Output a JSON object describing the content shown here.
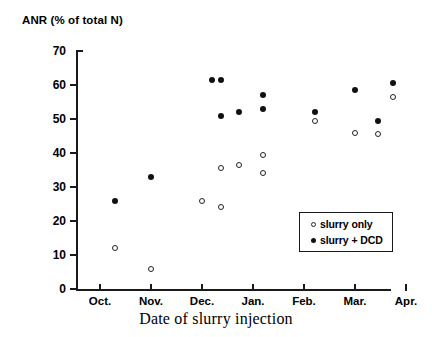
{
  "chart_data": {
    "type": "scatter",
    "title": "",
    "ylabel": "ANR (% of total N)",
    "xlabel": "Date of slurry injection",
    "ylim": [
      0,
      70
    ],
    "yticks": [
      0,
      10,
      20,
      30,
      40,
      50,
      60,
      70
    ],
    "ytick_labels": [
      "0",
      "10",
      "20",
      "30",
      "40",
      "50",
      "60",
      "70"
    ],
    "xtick_labels": [
      "Oct.",
      "Nov.",
      "Dec.",
      "Jan.",
      "Feb.",
      "Mar.",
      "Apr."
    ],
    "grid": false,
    "legend_position": "lower-right-inside",
    "series": [
      {
        "name": "slurry only",
        "marker": "open-circle",
        "color": "#ffffff",
        "edge_color": "#222222",
        "points": [
          {
            "x": "Oct.",
            "x_frac": 0.06,
            "y": 12.0
          },
          {
            "x": "Oct.-Nov.",
            "x_frac": 0.2,
            "y": 6.0
          },
          {
            "x": "Nov.-Dec.",
            "x_frac": 0.4,
            "y": 26.0
          },
          {
            "x": "Dec.",
            "x_frac": 0.475,
            "y": 24.0
          },
          {
            "x": "Dec.",
            "x_frac": 0.475,
            "y": 35.5
          },
          {
            "x": "Dec.",
            "x_frac": 0.545,
            "y": 36.5
          },
          {
            "x": "Jan.",
            "x_frac": 0.64,
            "y": 39.5
          },
          {
            "x": "Jan.",
            "x_frac": 0.64,
            "y": 34.0
          },
          {
            "x": "Feb.",
            "x_frac": 0.845,
            "y": 49.5
          },
          {
            "x": "Mar.",
            "x_frac": 1.0,
            "y": 46.0
          },
          {
            "x": "Mar.",
            "x_frac": 1.09,
            "y": 45.5
          },
          {
            "x": "Apr.",
            "x_frac": 1.15,
            "y": 56.5
          }
        ]
      },
      {
        "name": "slurry + DCD",
        "marker": "filled-circle",
        "color": "#111111",
        "points": [
          {
            "x": "Oct.",
            "x_frac": 0.06,
            "y": 26.0
          },
          {
            "x": "Oct.-Nov.",
            "x_frac": 0.2,
            "y": 33.0
          },
          {
            "x": "Dec.",
            "x_frac": 0.44,
            "y": 61.5
          },
          {
            "x": "Dec.",
            "x_frac": 0.475,
            "y": 61.5
          },
          {
            "x": "Dec.",
            "x_frac": 0.475,
            "y": 51.0
          },
          {
            "x": "Dec.",
            "x_frac": 0.545,
            "y": 52.0
          },
          {
            "x": "Jan.",
            "x_frac": 0.64,
            "y": 57.0
          },
          {
            "x": "Jan.",
            "x_frac": 0.64,
            "y": 53.0
          },
          {
            "x": "Feb.",
            "x_frac": 0.845,
            "y": 52.0
          },
          {
            "x": "Mar.",
            "x_frac": 1.0,
            "y": 58.5
          },
          {
            "x": "Mar.",
            "x_frac": 1.09,
            "y": 49.5
          },
          {
            "x": "Apr.",
            "x_frac": 1.15,
            "y": 60.5
          }
        ]
      }
    ],
    "legend": [
      {
        "label": "slurry only",
        "marker": "open-circle"
      },
      {
        "label": "slurry + DCD",
        "marker": "filled-circle"
      }
    ]
  },
  "axes": {
    "y_title": "ANR (% of total N)",
    "x_title": "Date of slurry injection",
    "y_labels": [
      "70",
      "60",
      "50",
      "40",
      "30",
      "20",
      "10",
      "0"
    ],
    "x_labels": [
      "Oct.",
      "Nov.",
      "Dec.",
      "Jan.",
      "Feb.",
      "Mar.",
      "Apr."
    ]
  },
  "legend": {
    "item_1": "slurry only",
    "item_2": "slurry + DCD"
  }
}
